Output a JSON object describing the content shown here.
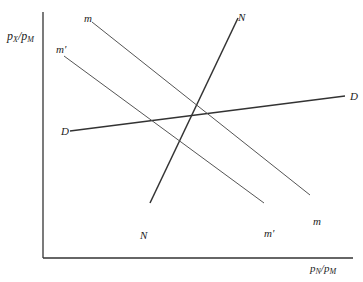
{
  "axes": {
    "y_label": {
      "p": "p",
      "num_sub": "X",
      "slash": "/p",
      "den_sub": "M"
    },
    "x_label": {
      "p": "p",
      "num_sub": "N",
      "slash": "/p",
      "den_sub": "M"
    }
  },
  "curves": [
    {
      "id": "D",
      "start_label": "D",
      "end_label": "D",
      "x1": 70,
      "y1": 131,
      "x2": 345,
      "y2": 96,
      "color": "#333333",
      "width": 1.3
    },
    {
      "id": "N",
      "start_label": "N",
      "end_label": "N",
      "x1": 150,
      "y1": 203,
      "x2": 238,
      "y2": 18,
      "color": "#333333",
      "width": 1.5
    },
    {
      "id": "m",
      "start_label": "m",
      "end_label": "m",
      "x1": 92,
      "y1": 22,
      "x2": 310,
      "y2": 195,
      "color": "#555555",
      "width": 1
    },
    {
      "id": "m_prime",
      "start_label": "m'",
      "end_label": "m'",
      "x1": 64,
      "y1": 56,
      "x2": 264,
      "y2": 203,
      "color": "#555555",
      "width": 1
    }
  ],
  "labels": {
    "m_top": "m",
    "m_bottom": "m",
    "mp_top": "m'",
    "mp_bottom": "m'",
    "N_top": "N",
    "N_bottom": "N",
    "D_left": "D",
    "D_right": "D"
  }
}
